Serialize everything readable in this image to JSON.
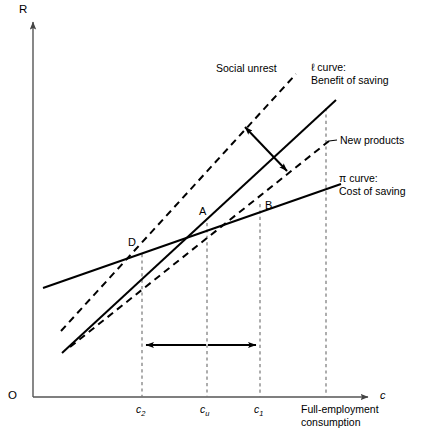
{
  "figure": {
    "title_alt": "",
    "axes": {
      "y_label": "R",
      "x_label": "c",
      "origin_label": "O",
      "axis_color": "#555555"
    },
    "curves": [
      {
        "id": "pi-curve",
        "style": "solid",
        "label": "π curve:\nCost of saving",
        "label_line1": "π curve:",
        "label_line2": "Cost of saving",
        "x1": 43,
        "y1": 288,
        "x2": 341,
        "y2": 184
      },
      {
        "id": "l-curve",
        "style": "solid",
        "label": "ℓ curve:\nBenefit of saving",
        "label_line1": "ℓ curve:",
        "label_line2": "Benefit of saving",
        "x1": 62,
        "y1": 353,
        "x2": 336,
        "y2": 100
      },
      {
        "id": "social-unrest-curve",
        "style": "dashed",
        "label": "Social unrest",
        "x1": 61,
        "y1": 331,
        "x2": 296,
        "y2": 74
      },
      {
        "id": "new-products-curve",
        "style": "dashed",
        "label": "New products",
        "x1": 70,
        "y1": 347,
        "x2": 329,
        "y2": 141
      }
    ],
    "points": [
      {
        "id": "point-d",
        "label": "D",
        "x": 142,
        "y": 254,
        "label_x": 128,
        "label_y": 238
      },
      {
        "id": "point-a",
        "label": "A",
        "x": 207,
        "y": 223,
        "label_x": 198,
        "label_y": 206
      },
      {
        "id": "point-b",
        "label": "B",
        "x": 260,
        "y": 205,
        "label_x": 264,
        "label_y": 201
      }
    ],
    "gridlines": [
      {
        "id": "gridline-c2",
        "x": 142,
        "y_top": 254,
        "y_bottom": 397,
        "tick_label": "c",
        "tick_sub": "2"
      },
      {
        "id": "gridline-cu",
        "x": 207,
        "y_top": 223,
        "y_bottom": 397,
        "tick_label": "c",
        "tick_sub": "u"
      },
      {
        "id": "gridline-c1",
        "x": 260,
        "y_top": 204,
        "y_bottom": 397,
        "tick_label": "c",
        "tick_sub": "1"
      },
      {
        "id": "gridline-full-employment",
        "x": 326,
        "y_top": 108,
        "y_bottom": 397,
        "tick_label": "",
        "tick_sub": ""
      }
    ],
    "full_employment_label_line1": "Full-employment",
    "full_employment_label_line2": "consumption",
    "shift_arrow": {
      "id": "shift-arrow",
      "x1": 244,
      "y1": 125,
      "x2": 288,
      "y2": 172,
      "double_headed": true
    },
    "range_arrows": [
      {
        "id": "range-arrow-left",
        "x1": 207,
        "y1": 345,
        "x2": 143,
        "y2": 345
      },
      {
        "id": "range-arrow-right",
        "x1": 207,
        "y1": 345,
        "x2": 259,
        "y2": 345
      }
    ]
  }
}
